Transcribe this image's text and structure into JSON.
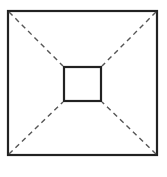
{
  "diagram": {
    "outer_square": {
      "x": 8,
      "y": 11,
      "w": 149,
      "h": 144
    },
    "inner_square": {
      "x": 64,
      "y": 67,
      "w": 37,
      "h": 34
    },
    "colors": {
      "stroke": "#222222",
      "dash": "#555555",
      "background": "#ffffff"
    }
  }
}
